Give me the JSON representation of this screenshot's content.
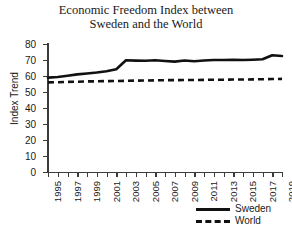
{
  "chart_data": {
    "type": "line",
    "title": "Economic Freedom Index between\nSweden and the World",
    "xlabel": "",
    "ylabel": "Index Trend",
    "ylim": [
      0,
      80
    ],
    "ytick_labels": [
      "80",
      "70",
      "60",
      "50",
      "40",
      "30",
      "20",
      "10",
      "0"
    ],
    "ytick_values": [
      80,
      70,
      60,
      50,
      40,
      30,
      20,
      10,
      0
    ],
    "grid": false,
    "legend_position": "bottom-right",
    "x": [
      1995,
      1996,
      1997,
      1998,
      1999,
      2000,
      2001,
      2002,
      2003,
      2004,
      2005,
      2006,
      2007,
      2008,
      2009,
      2010,
      2011,
      2012,
      2013,
      2014,
      2015,
      2016,
      2017,
      2018,
      2019
    ],
    "xtick_labels": [
      "1995",
      "",
      "1997",
      "",
      "1999",
      "",
      "2001",
      "",
      "2003",
      "",
      "2005",
      "",
      "2007",
      "",
      "2009",
      "",
      "2011",
      "",
      "2013",
      "",
      "2015",
      "",
      "2017",
      "",
      "2019"
    ],
    "series": [
      {
        "name": "Sweden",
        "style": "solid",
        "color": "#111111",
        "values": [
          59.0,
          59.4,
          60.2,
          61.0,
          61.6,
          62.2,
          63.0,
          64.2,
          69.8,
          69.6,
          69.5,
          69.8,
          69.4,
          69.0,
          69.7,
          69.2,
          69.7,
          70.0,
          70.0,
          70.1,
          70.0,
          70.2,
          70.5,
          73.0,
          72.5
        ]
      },
      {
        "name": "World",
        "style": "dashed",
        "color": "#111111",
        "values": [
          56.0,
          56.1,
          56.3,
          56.4,
          56.6,
          56.7,
          56.8,
          56.9,
          57.0,
          57.1,
          57.2,
          57.3,
          57.4,
          57.4,
          57.5,
          57.5,
          57.6,
          57.7,
          57.7,
          57.8,
          57.8,
          57.9,
          58.0,
          58.1,
          58.2
        ]
      }
    ]
  },
  "legend": {
    "items": [
      {
        "label": "Sweden",
        "style": "solid"
      },
      {
        "label": "World",
        "style": "dashed"
      }
    ]
  }
}
